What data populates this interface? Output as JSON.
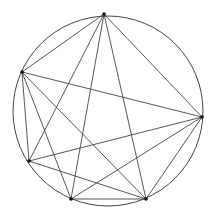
{
  "diagram": {
    "type": "inscribed-graph",
    "width": 215,
    "height": 219,
    "stroke_color": "#444444",
    "vertex_color": "#111111",
    "circle": {
      "cx": 108,
      "cy": 111,
      "r": 95
    },
    "vertices": [
      {
        "id": "A",
        "x": 104,
        "y": 14
      },
      {
        "id": "B",
        "x": 22,
        "y": 72
      },
      {
        "id": "C",
        "x": 202,
        "y": 117
      },
      {
        "id": "D",
        "x": 29,
        "y": 161
      },
      {
        "id": "E",
        "x": 71,
        "y": 199
      },
      {
        "id": "F",
        "x": 146,
        "y": 199
      }
    ],
    "edges": [
      [
        "A",
        "B"
      ],
      [
        "A",
        "C"
      ],
      [
        "A",
        "D"
      ],
      [
        "A",
        "E"
      ],
      [
        "A",
        "F"
      ],
      [
        "B",
        "C"
      ],
      [
        "B",
        "D"
      ],
      [
        "B",
        "E"
      ],
      [
        "B",
        "F"
      ],
      [
        "C",
        "D"
      ],
      [
        "C",
        "E"
      ],
      [
        "C",
        "F"
      ],
      [
        "D",
        "F"
      ],
      [
        "E",
        "F"
      ]
    ]
  }
}
